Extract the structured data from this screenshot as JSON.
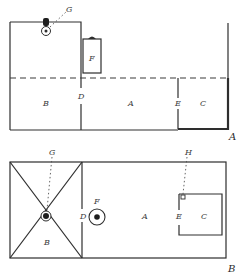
{
  "figure_top": {
    "caption": "A",
    "view": "elevation / section",
    "labels": {
      "room_b": "B",
      "wall_d": "D",
      "room_a": "A",
      "wall_e": "E",
      "room_c": "C",
      "heater_f": "F",
      "lamp_g": "G"
    }
  },
  "figure_bottom": {
    "caption": "B",
    "view": "plan",
    "labels": {
      "room_b": "B",
      "wall_d": "D",
      "room_a": "A",
      "wall_e": "E",
      "room_c": "C",
      "heater_f": "F",
      "lamp_g": "G",
      "vent_h": "H"
    }
  },
  "colors": {
    "line": "#2e2e2e",
    "background": "#ffffff"
  }
}
